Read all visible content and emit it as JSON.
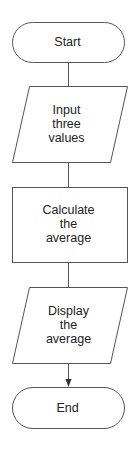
{
  "diagram": {
    "type": "flowchart",
    "stroke_color": "#555555",
    "text_color": "#222222",
    "nodes": [
      {
        "id": "start",
        "shape": "terminator",
        "label": "Start"
      },
      {
        "id": "input",
        "shape": "parallelogram",
        "label": "Input\nthree\nvalues"
      },
      {
        "id": "calculate",
        "shape": "rectangle",
        "label": "Calculate\nthe\naverage"
      },
      {
        "id": "display",
        "shape": "parallelogram",
        "label": "Display\nthe\naverage"
      },
      {
        "id": "end",
        "shape": "terminator",
        "label": "End"
      }
    ],
    "edges": [
      {
        "from": "start",
        "to": "input",
        "arrow": false
      },
      {
        "from": "input",
        "to": "calculate",
        "arrow": false
      },
      {
        "from": "calculate",
        "to": "display",
        "arrow": false
      },
      {
        "from": "display",
        "to": "end",
        "arrow": true
      }
    ]
  }
}
